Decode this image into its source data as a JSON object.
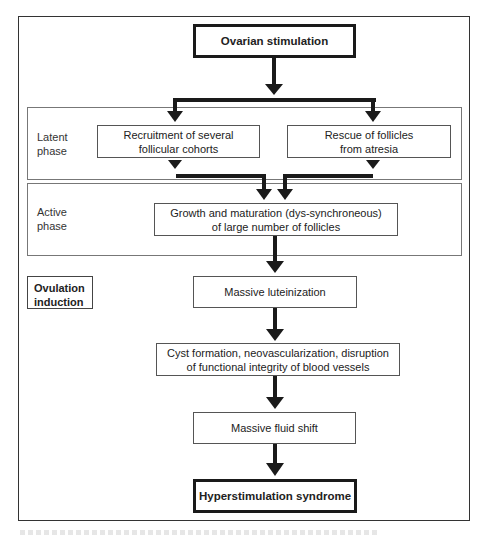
{
  "diagram": {
    "start_node": "Ovarian stimulation",
    "phases": [
      {
        "label_line1": "Latent",
        "label_line2": "phase"
      },
      {
        "label_line1": "Active",
        "label_line2": "phase"
      }
    ],
    "nodes": {
      "recruitment": {
        "line1": "Recruitment of several",
        "line2": "follicular cohorts"
      },
      "rescue": {
        "line1": "Rescue of follicles",
        "line2": "from atresia"
      },
      "growth": {
        "line1": "Growth and maturation (dys-synchroneous)",
        "line2": "of large number of follicles"
      },
      "luteinization": "Massive luteinization",
      "cyst": {
        "line1": "Cyst formation, neovascularization, disruption",
        "line2": "of functional integrity of blood vessels"
      },
      "fluid_shift": "Massive fluid shift"
    },
    "side_label": {
      "line1": "Ovulation",
      "line2": "induction"
    },
    "end_node": "Hyperstimulation syndrome",
    "edges": [
      [
        "Ovarian stimulation",
        "Recruitment of several follicular cohorts"
      ],
      [
        "Ovarian stimulation",
        "Rescue of follicles from atresia"
      ],
      [
        "Recruitment of several follicular cohorts",
        "Growth and maturation (dys-synchroneous) of large number of follicles"
      ],
      [
        "Rescue of follicles from atresia",
        "Growth and maturation (dys-synchroneous) of large number of follicles"
      ],
      [
        "Growth and maturation (dys-synchroneous) of large number of follicles",
        "Massive luteinization"
      ],
      [
        "Massive luteinization",
        "Cyst formation, neovascularization, disruption of functional integrity of blood vessels"
      ],
      [
        "Cyst formation, neovascularization, disruption of functional integrity of blood vessels",
        "Massive fluid shift"
      ],
      [
        "Massive fluid shift",
        "Hyperstimulation syndrome"
      ]
    ],
    "colors": {
      "line": "#1a1a1a",
      "box_border": "#555555",
      "background": "#ffffff"
    }
  }
}
